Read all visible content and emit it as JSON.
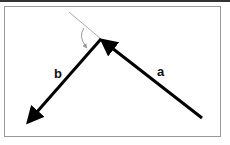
{
  "diagram": {
    "vectors": [
      {
        "name": "a",
        "label": "a",
        "from": [
          202,
          118
        ],
        "to": [
          101,
          39
        ]
      },
      {
        "name": "b",
        "label": "b",
        "from": [
          101,
          39
        ],
        "to": [
          25,
          126
        ]
      }
    ],
    "extension_line": {
      "from": [
        69,
        12
      ],
      "to": [
        101,
        39
      ],
      "color": "#aaaaaa"
    },
    "angle_arc": {
      "color": "#999999"
    },
    "colors": {
      "vector": "#000000",
      "frame": "#999999",
      "topbar": "#333333"
    }
  }
}
